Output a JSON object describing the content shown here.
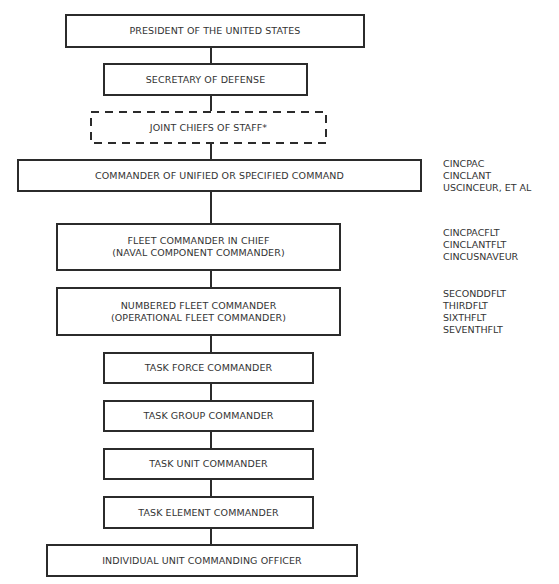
{
  "diagram": {
    "type": "organizational-chain-of-command",
    "accent_color": "#2b2b2b",
    "nodes": [
      {
        "id": "president",
        "lines": [
          "PRESIDENT OF THE UNITED STATES"
        ],
        "style": "solid"
      },
      {
        "id": "secdef",
        "lines": [
          "SECRETARY OF DEFENSE"
        ],
        "style": "solid"
      },
      {
        "id": "jcs",
        "lines": [
          "JOINT CHIEFS OF STAFF*"
        ],
        "style": "dashed"
      },
      {
        "id": "unified",
        "lines": [
          "COMMANDER OF UNIFIED OR SPECIFIED COMMAND"
        ],
        "style": "solid"
      },
      {
        "id": "fleet-cinc",
        "lines": [
          "FLEET COMMANDER IN CHIEF",
          "(NAVAL COMPONENT COMMANDER)"
        ],
        "style": "solid"
      },
      {
        "id": "numbered-fleet",
        "lines": [
          "NUMBERED FLEET COMMANDER",
          "(OPERATIONAL FLEET COMMANDER)"
        ],
        "style": "solid"
      },
      {
        "id": "task-force",
        "lines": [
          "TASK FORCE COMMANDER"
        ],
        "style": "solid"
      },
      {
        "id": "task-group",
        "lines": [
          "TASK GROUP COMMANDER"
        ],
        "style": "solid"
      },
      {
        "id": "task-unit",
        "lines": [
          "TASK UNIT COMMANDER"
        ],
        "style": "solid"
      },
      {
        "id": "task-element",
        "lines": [
          "TASK ELEMENT COMMANDER"
        ],
        "style": "solid"
      },
      {
        "id": "individual-unit",
        "lines": [
          "INDIVIDUAL UNIT COMMANDING OFFICER"
        ],
        "style": "solid"
      }
    ],
    "side_labels": [
      {
        "for": "unified",
        "lines": [
          "CINCPAC",
          "CINCLANT",
          "USCINCEUR, ET AL"
        ]
      },
      {
        "for": "fleet-cinc",
        "lines": [
          "CINCPACFLT",
          "CINCLANTFLT",
          "CINCUSNAVEUR"
        ]
      },
      {
        "for": "numbered-fleet",
        "lines": [
          "SECONDDFLT",
          "THIRDFLT",
          "SIXTHFLT",
          "SEVENTHFLT"
        ]
      }
    ],
    "edges": [
      [
        "president",
        "secdef"
      ],
      [
        "secdef",
        "jcs"
      ],
      [
        "jcs",
        "unified"
      ],
      [
        "unified",
        "fleet-cinc"
      ],
      [
        "fleet-cinc",
        "numbered-fleet"
      ],
      [
        "numbered-fleet",
        "task-force"
      ],
      [
        "task-force",
        "task-group"
      ],
      [
        "task-group",
        "task-unit"
      ],
      [
        "task-unit",
        "task-element"
      ],
      [
        "task-element",
        "individual-unit"
      ]
    ]
  }
}
